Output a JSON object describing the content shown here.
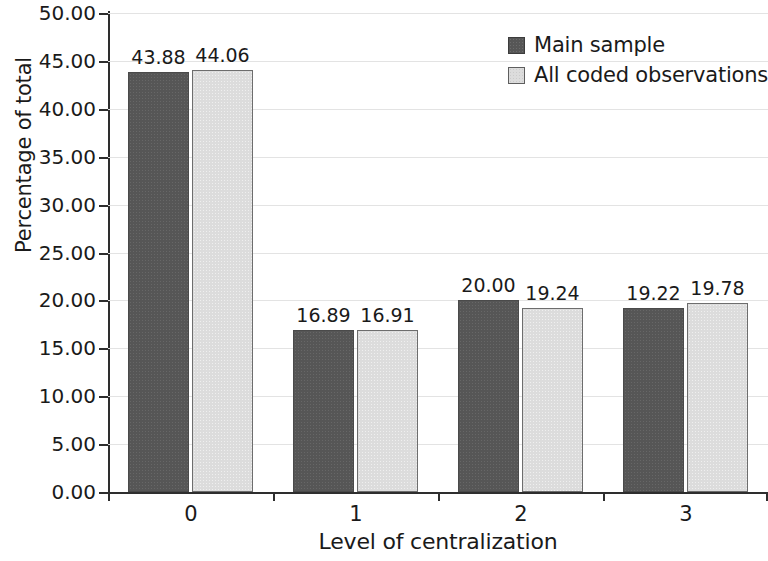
{
  "chart_data": {
    "type": "bar",
    "title": "",
    "xlabel": "Level of centralization",
    "ylabel": "Percentage of total",
    "categories": [
      "0",
      "1",
      "2",
      "3"
    ],
    "series": [
      {
        "name": "Main sample",
        "color": "#565656",
        "values": [
          43.88,
          16.89,
          20.0,
          19.22
        ],
        "labels": [
          "43.88",
          "16.89",
          "20.00",
          "19.22"
        ]
      },
      {
        "name": "All coded observations",
        "color": "#dcdcdc",
        "values": [
          44.06,
          16.91,
          19.24,
          19.78
        ],
        "labels": [
          "44.06",
          "16.91",
          "19.24",
          "19.78"
        ]
      }
    ],
    "ylim": [
      0,
      50
    ],
    "ytick_step": 5,
    "ytick_labels": [
      "0.00",
      "5.00",
      "10.00",
      "15.00",
      "20.00",
      "25.00",
      "30.00",
      "35.00",
      "40.00",
      "45.00",
      "50.00"
    ],
    "grid": true,
    "grid_axis": "y",
    "legend_position": "top-right"
  }
}
